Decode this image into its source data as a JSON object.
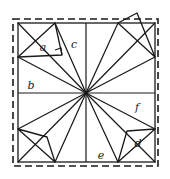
{
  "figure": {
    "background_color": "#ffffff",
    "stroke_color": "#1a1a1a",
    "label_color": "#1a1a1a",
    "outer_border": {
      "style": "dashed",
      "shape": "square",
      "x": 13,
      "y": 19,
      "width": 145,
      "height": 147
    },
    "inner_border": {
      "style": "solid",
      "shape": "square",
      "x": 18,
      "y": 23,
      "width": 137,
      "height": 139
    },
    "center_point": {
      "x": 86,
      "y": 93
    },
    "labels": [
      {
        "id": "a",
        "text": "a",
        "x": 43,
        "y": 51
      },
      {
        "id": "b",
        "text": "b",
        "x": 31,
        "y": 89
      },
      {
        "id": "c",
        "text": "c",
        "x": 74,
        "y": 48
      },
      {
        "id": "d",
        "text": "d",
        "x": 138,
        "y": 147
      },
      {
        "id": "e",
        "text": "e",
        "x": 101,
        "y": 159
      },
      {
        "id": "f",
        "text": "f",
        "x": 137,
        "y": 111
      }
    ],
    "grid_lines": [
      {
        "name": "vertical-midline",
        "x1": 86,
        "y1": 23,
        "x2": 86,
        "y2": 162
      },
      {
        "name": "horizontal-midline",
        "x1": 18,
        "y1": 93,
        "x2": 155,
        "y2": 93
      }
    ],
    "spokes": [
      {
        "name": "spoke-to-top-left-corner",
        "x2": 18,
        "y2": 23
      },
      {
        "name": "spoke-to-top-mid",
        "x2": 55,
        "y2": 23
      },
      {
        "name": "spoke-to-top-right-area",
        "x2": 118,
        "y2": 23
      },
      {
        "name": "spoke-to-right-upper",
        "x2": 155,
        "y2": 57
      },
      {
        "name": "spoke-to-right-corner",
        "x2": 155,
        "y2": 23
      },
      {
        "name": "spoke-to-left-upper",
        "x2": 18,
        "y2": 57
      },
      {
        "name": "spoke-to-left-lower",
        "x2": 18,
        "y2": 129
      },
      {
        "name": "spoke-to-bottom-left-mid",
        "x2": 55,
        "y2": 162
      },
      {
        "name": "spoke-to-bottom-right-mid",
        "x2": 118,
        "y2": 162
      },
      {
        "name": "spoke-to-right-lower",
        "x2": 155,
        "y2": 129
      }
    ],
    "triangles": [
      {
        "name": "triangle-a",
        "label": "a",
        "points": "18,57 55,23 62,55",
        "has_right_angle_mark": true
      },
      {
        "name": "triangle-top-right-outer",
        "label": "",
        "points": "118,23 137,13 155,57",
        "has_right_angle_mark": false
      },
      {
        "name": "triangle-bottom-left-outer",
        "label": "",
        "points": "18,129 47,137 55,162",
        "has_right_angle_mark": false
      },
      {
        "name": "triangle-d",
        "label": "d",
        "points": "118,162 127,131 155,129",
        "has_right_angle_mark": false
      }
    ]
  }
}
